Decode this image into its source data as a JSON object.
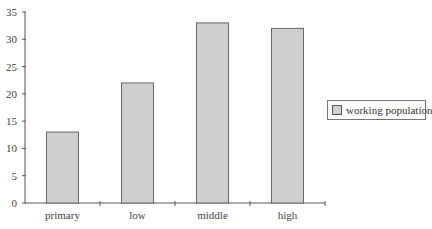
{
  "chart_data": {
    "type": "bar",
    "title": "",
    "xlabel": "",
    "ylabel": "",
    "categories": [
      "primary",
      "low",
      "middle",
      "high"
    ],
    "series": [
      {
        "name": "working population",
        "values": [
          13,
          22,
          33,
          32
        ],
        "color": "#cfcfcf"
      }
    ],
    "ylim": [
      0,
      35
    ],
    "yticks": [
      0,
      5,
      10,
      15,
      20,
      25,
      30,
      35
    ],
    "grid": false,
    "legend_position": "right"
  },
  "legend": {
    "label": "working population"
  }
}
